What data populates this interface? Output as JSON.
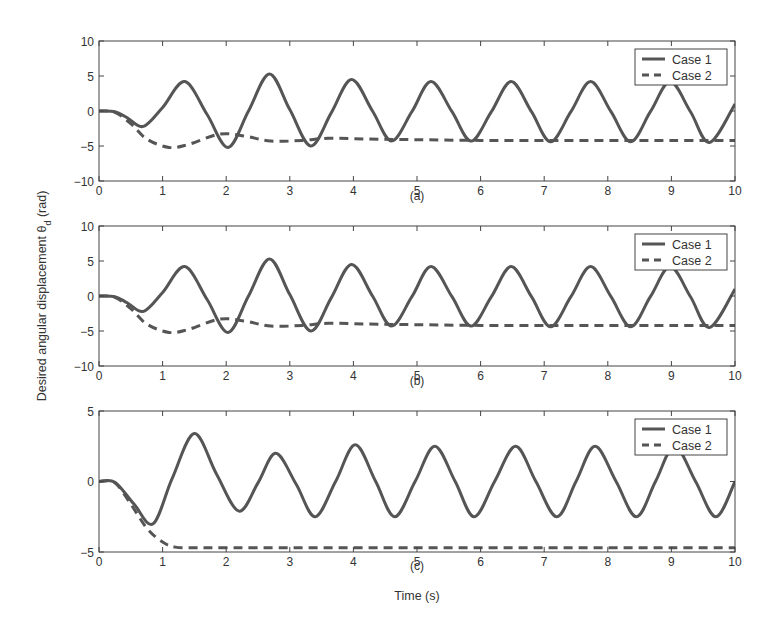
{
  "figure": {
    "ylabel": "Desired angular displacement θ",
    "ylabel_sub": "d",
    "ylabel_unit": " (rad)",
    "xlabel": "Time (s)"
  },
  "colors": {
    "line": "#555555",
    "axis": "#444444",
    "text": "#333333"
  },
  "chart_data": [
    {
      "type": "line",
      "panel": "(a)",
      "xlabel": "",
      "ylabel": "Desired angular displacement θd (rad)",
      "xlim": [
        0,
        10
      ],
      "ylim": [
        -10,
        10
      ],
      "xticks": [
        0,
        1,
        2,
        3,
        4,
        5,
        6,
        7,
        8,
        9,
        10
      ],
      "yticks": [
        -10,
        -5,
        0,
        5,
        10
      ],
      "legend": {
        "position": "upper right",
        "entries": [
          "Case 1",
          "Case 2"
        ]
      },
      "grid": false,
      "series": [
        {
          "name": "Case 1",
          "style": "solid",
          "x": [
            0,
            0.25,
            0.45,
            0.7,
            1.0,
            1.35,
            1.7,
            2.03,
            2.35,
            2.68,
            3.0,
            3.33,
            3.65,
            3.97,
            4.3,
            4.6,
            4.92,
            5.22,
            5.55,
            5.85,
            6.17,
            6.48,
            6.8,
            7.1,
            7.42,
            7.73,
            8.05,
            8.36,
            8.67,
            8.98,
            9.3,
            9.6,
            10
          ],
          "y": [
            0,
            -0.1,
            -1,
            -2.2,
            0.5,
            4.2,
            -0.5,
            -5.2,
            0,
            5.3,
            0.2,
            -5.0,
            -0.3,
            4.5,
            0,
            -4.3,
            -0.1,
            4.2,
            -0.1,
            -4.3,
            -0.1,
            4.2,
            -0.1,
            -4.4,
            -0.1,
            4.2,
            -0.1,
            -4.4,
            -0.1,
            4.2,
            -0.1,
            -4.5,
            1.0
          ]
        },
        {
          "name": "Case 2",
          "style": "dashed",
          "x": [
            0,
            0.25,
            0.5,
            0.75,
            1.1,
            1.4,
            1.9,
            2.3,
            2.7,
            3.2,
            3.6,
            4.2,
            5,
            6,
            7,
            8,
            9,
            10
          ],
          "y": [
            0,
            -0.2,
            -1.8,
            -4.0,
            -5.2,
            -4.8,
            -3.3,
            -3.6,
            -4.3,
            -4.2,
            -3.9,
            -4.0,
            -4.1,
            -4.2,
            -4.2,
            -4.2,
            -4.2,
            -4.2
          ]
        }
      ]
    },
    {
      "type": "line",
      "panel": "(b)",
      "xlim": [
        0,
        10
      ],
      "ylim": [
        -10,
        10
      ],
      "xticks": [
        0,
        1,
        2,
        3,
        4,
        5,
        6,
        7,
        8,
        9,
        10
      ],
      "yticks": [
        -10,
        -5,
        0,
        5,
        10
      ],
      "legend": {
        "position": "upper right",
        "entries": [
          "Case 1",
          "Case 2"
        ]
      },
      "grid": false,
      "series": [
        {
          "name": "Case 1",
          "style": "solid",
          "x": [
            0,
            0.25,
            0.45,
            0.7,
            1.0,
            1.35,
            1.7,
            2.03,
            2.35,
            2.68,
            3.0,
            3.33,
            3.65,
            3.97,
            4.3,
            4.6,
            4.92,
            5.22,
            5.55,
            5.85,
            6.17,
            6.48,
            6.8,
            7.1,
            7.42,
            7.73,
            8.05,
            8.36,
            8.67,
            8.98,
            9.3,
            9.6,
            10
          ],
          "y": [
            0,
            -0.1,
            -1,
            -2.2,
            0.5,
            4.2,
            -0.5,
            -5.2,
            0,
            5.3,
            0.2,
            -5.0,
            -0.3,
            4.5,
            0,
            -4.3,
            -0.1,
            4.2,
            -0.1,
            -4.3,
            -0.1,
            4.2,
            -0.1,
            -4.4,
            -0.1,
            4.2,
            -0.1,
            -4.4,
            -0.1,
            4.2,
            -0.1,
            -4.5,
            1.0
          ]
        },
        {
          "name": "Case 2",
          "style": "dashed",
          "x": [
            0,
            0.25,
            0.5,
            0.75,
            1.1,
            1.4,
            1.9,
            2.3,
            2.7,
            3.2,
            3.6,
            4.2,
            5,
            6,
            7,
            8,
            9,
            10
          ],
          "y": [
            0,
            -0.2,
            -1.8,
            -4.0,
            -5.2,
            -4.8,
            -3.3,
            -3.6,
            -4.3,
            -4.2,
            -3.9,
            -4.0,
            -4.1,
            -4.2,
            -4.2,
            -4.2,
            -4.2,
            -4.2
          ]
        }
      ]
    },
    {
      "type": "line",
      "panel": "(c)",
      "xlabel": "Time (s)",
      "xlim": [
        0,
        10
      ],
      "ylim": [
        -5,
        5
      ],
      "xticks": [
        0,
        1,
        2,
        3,
        4,
        5,
        6,
        7,
        8,
        9,
        10
      ],
      "yticks": [
        -5,
        0,
        5
      ],
      "legend": {
        "position": "upper right",
        "entries": [
          "Case 1",
          "Case 2"
        ]
      },
      "grid": false,
      "series": [
        {
          "name": "Case 1",
          "style": "solid",
          "x": [
            0,
            0.25,
            0.55,
            0.85,
            1.15,
            1.5,
            1.85,
            2.2,
            2.5,
            2.78,
            3.1,
            3.4,
            3.72,
            4.03,
            4.35,
            4.65,
            4.97,
            5.28,
            5.6,
            5.9,
            6.22,
            6.55,
            6.87,
            7.2,
            7.5,
            7.8,
            8.13,
            8.45,
            8.75,
            9.05,
            9.38,
            9.7,
            10
          ],
          "y": [
            0,
            -0.05,
            -1.6,
            -3.0,
            0.2,
            3.4,
            0.5,
            -2.1,
            -0.1,
            2.0,
            -0.2,
            -2.5,
            0,
            2.6,
            0,
            -2.5,
            0,
            2.5,
            0,
            -2.5,
            0,
            2.5,
            0,
            -2.5,
            0,
            2.5,
            0,
            -2.5,
            0,
            2.5,
            0,
            -2.5,
            0
          ]
        },
        {
          "name": "Case 2",
          "style": "dashed",
          "x": [
            0,
            0.25,
            0.5,
            0.75,
            1.0,
            1.2,
            1.5,
            2,
            3,
            4,
            5,
            6,
            7,
            8,
            9,
            10
          ],
          "y": [
            0,
            -0.1,
            -1.6,
            -3.3,
            -4.3,
            -4.65,
            -4.7,
            -4.7,
            -4.7,
            -4.7,
            -4.7,
            -4.7,
            -4.7,
            -4.7,
            -4.7,
            -4.7
          ]
        }
      ]
    }
  ]
}
